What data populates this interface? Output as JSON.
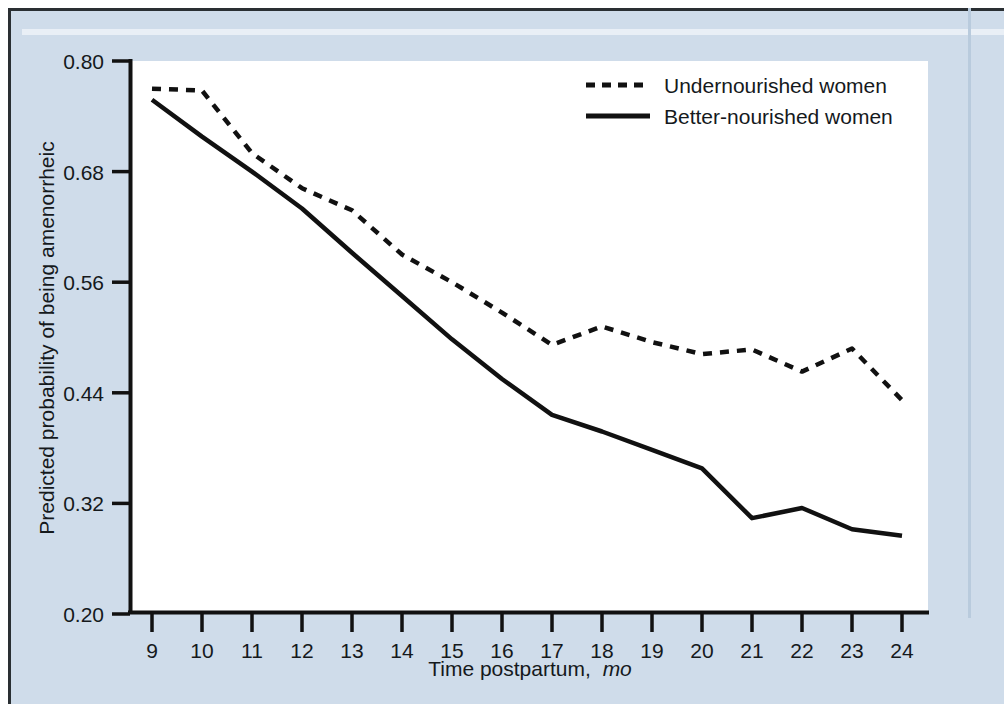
{
  "figure": {
    "background_color": "#cfdcea",
    "plot_background_color": "#ffffff",
    "line_color": "#111111"
  },
  "chart_data": {
    "type": "line",
    "title": "",
    "xlabel": "Time postpartum, mo",
    "xlabel_main": "Time postpartum,",
    "xlabel_italic": "mo",
    "ylabel": "Predicted probability of being amenorrheic",
    "x": [
      9,
      10,
      11,
      12,
      13,
      14,
      15,
      16,
      17,
      18,
      19,
      20,
      21,
      22,
      23,
      24
    ],
    "xtick_labels": [
      "9",
      "10",
      "11",
      "12",
      "13",
      "14",
      "15",
      "16",
      "17",
      "18",
      "19",
      "20",
      "21",
      "22",
      "23",
      "24"
    ],
    "ytick_labels": [
      "0.80",
      "0.68",
      "0.56",
      "0.44",
      "0.32",
      "0.20"
    ],
    "yticks": [
      0.8,
      0.68,
      0.56,
      0.44,
      0.32,
      0.2
    ],
    "xlim": [
      9,
      24
    ],
    "ylim": [
      0.2,
      0.8
    ],
    "grid": false,
    "legend_position": "top-right",
    "series": [
      {
        "name": "Undernourished women",
        "style": "dashed",
        "values": [
          0.77,
          0.768,
          0.7,
          0.662,
          0.638,
          0.59,
          0.56,
          0.527,
          0.492,
          0.512,
          0.495,
          0.482,
          0.487,
          0.463,
          0.488,
          0.432
        ]
      },
      {
        "name": "Better-nourished women",
        "style": "solid",
        "values": [
          0.758,
          0.718,
          0.68,
          0.64,
          0.592,
          0.545,
          0.498,
          0.455,
          0.416,
          0.398,
          0.378,
          0.358,
          0.304,
          0.315,
          0.292,
          0.285
        ]
      }
    ]
  }
}
